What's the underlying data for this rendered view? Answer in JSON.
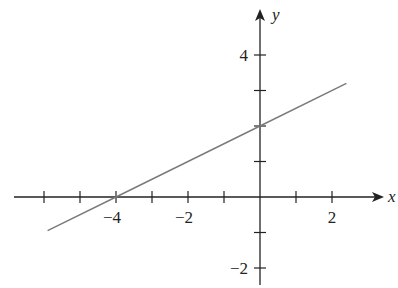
{
  "chart_data": {
    "type": "line",
    "title": "",
    "xlabel": "x",
    "ylabel": "y",
    "xlim": [
      -6.3,
      3.3
    ],
    "ylim": [
      -2.5,
      5.2
    ],
    "grid": false,
    "x_ticks": [
      -6,
      -5,
      -4,
      -3,
      -2,
      -1,
      1,
      2
    ],
    "x_tick_labels": [
      {
        "value": -4,
        "label": "−4"
      },
      {
        "value": -2,
        "label": "−2"
      },
      {
        "value": 2,
        "label": "2"
      }
    ],
    "y_ticks": [
      -2,
      -1,
      1,
      2,
      3,
      4
    ],
    "y_tick_labels": [
      {
        "value": 4,
        "label": "4"
      },
      {
        "value": -2,
        "label": "−2"
      }
    ],
    "series": [
      {
        "name": "line",
        "x": [
          -5.9,
          -4,
          0,
          2.4
        ],
        "y": [
          -0.95,
          0,
          2,
          3.2
        ],
        "color": "#7a7a7a"
      }
    ]
  },
  "axes": {
    "x_label": "x",
    "y_label": "y",
    "color": "#222222"
  }
}
